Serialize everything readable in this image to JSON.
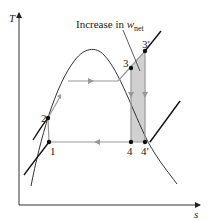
{
  "diagram": {
    "type": "T-s diagram, Rankine cycle with superheat",
    "axes": {
      "y_label": "T",
      "x_label": "s"
    },
    "annotation": {
      "text_main": "Increase in ",
      "text_var": "w",
      "text_sub": "net"
    },
    "points": [
      {
        "id": "1",
        "label": "1"
      },
      {
        "id": "2",
        "label": "2"
      },
      {
        "id": "3",
        "label": "3"
      },
      {
        "id": "3p",
        "label": "3′"
      },
      {
        "id": "4",
        "label": "4"
      },
      {
        "id": "4p",
        "label": "4′"
      }
    ],
    "colors": {
      "curve": "#333333",
      "process_line": "#999999",
      "shade": "#d0d0d0",
      "isobar": "#111111"
    }
  }
}
